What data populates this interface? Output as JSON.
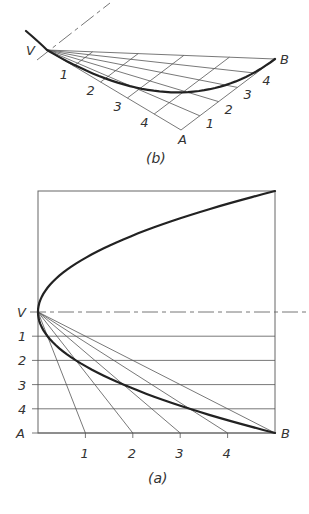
{
  "figure_b": {
    "caption": "(b)",
    "points": {
      "V": {
        "label": "V",
        "x": 47,
        "y": 50
      },
      "A": {
        "label": "A",
        "x": 181,
        "y": 130
      },
      "B": {
        "label": "B",
        "x": 275,
        "y": 59
      }
    },
    "divisions": 5,
    "va_labels": [
      "1",
      "2",
      "3",
      "4"
    ],
    "ab_labels": [
      "1",
      "2",
      "3",
      "4"
    ],
    "axis_line": {
      "x1": 37,
      "y1": 60,
      "x2": 110,
      "y2": 3
    },
    "curve_tail": {
      "x": 26,
      "y": 31
    }
  },
  "figure_a": {
    "caption": "(a)",
    "frame": {
      "left": 38,
      "top": 191,
      "right": 275,
      "bottom": 433
    },
    "vertex": {
      "label": "V",
      "x": 38,
      "y": 312
    },
    "corner_A": {
      "label": "A",
      "x": 38,
      "y": 433
    },
    "corner_B": {
      "label": "B",
      "x": 275,
      "y": 433
    },
    "divisions": 5,
    "vertical_labels": [
      "1",
      "2",
      "3",
      "4"
    ],
    "horizontal_labels": [
      "1",
      "2",
      "3",
      "4"
    ],
    "axis_extends_to": 306
  },
  "colors": {
    "ink": "#222222",
    "thin": "#555555",
    "background": "#ffffff"
  }
}
